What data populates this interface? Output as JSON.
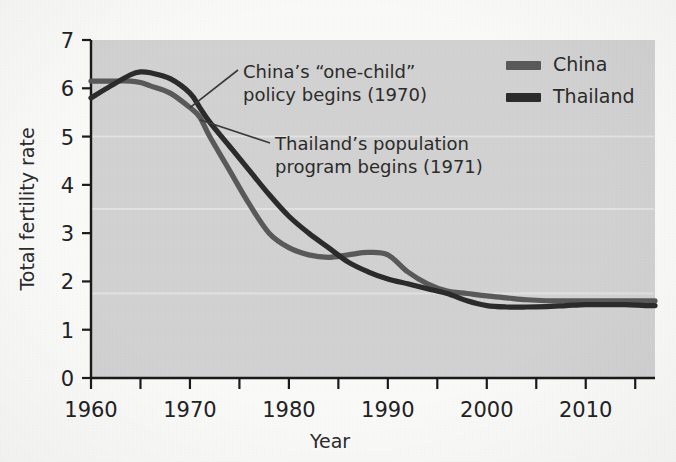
{
  "chart_data": {
    "type": "line",
    "title": "",
    "xlabel": "Year",
    "ylabel": "Total fertility rate",
    "xlim": [
      1960,
      2017
    ],
    "ylim": [
      0,
      7
    ],
    "xticks": [
      1960,
      1970,
      1980,
      1990,
      2000,
      2010
    ],
    "xminor_ticks": [
      1965,
      1975,
      1985,
      1995,
      2005,
      2015
    ],
    "yticks": [
      0,
      1,
      2,
      3,
      4,
      5,
      6,
      7
    ],
    "grid": "faint-horizontal",
    "legend_position": "top-right",
    "plot_background": "#d2d2d2",
    "series": [
      {
        "name": "China",
        "color": "#5a5a5a",
        "x": [
          1960,
          1962,
          1964,
          1965,
          1966,
          1968,
          1970,
          1971,
          1972,
          1974,
          1976,
          1978,
          1980,
          1982,
          1984,
          1986,
          1988,
          1990,
          1992,
          1994,
          1996,
          1998,
          2000,
          2002,
          2004,
          2006,
          2008,
          2010,
          2012,
          2014,
          2016,
          2017
        ],
        "y": [
          6.15,
          6.15,
          6.15,
          6.12,
          6.05,
          5.9,
          5.6,
          5.4,
          5.0,
          4.3,
          3.6,
          3.0,
          2.7,
          2.55,
          2.5,
          2.55,
          2.6,
          2.55,
          2.2,
          1.95,
          1.8,
          1.75,
          1.7,
          1.66,
          1.62,
          1.6,
          1.6,
          1.6,
          1.6,
          1.6,
          1.6,
          1.6
        ]
      },
      {
        "name": "Thailand",
        "color": "#2b2b2b",
        "x": [
          1960,
          1962,
          1964,
          1965,
          1966,
          1968,
          1970,
          1971,
          1972,
          1974,
          1976,
          1978,
          1980,
          1982,
          1984,
          1986,
          1988,
          1990,
          1992,
          1994,
          1996,
          1998,
          2000,
          2002,
          2004,
          2006,
          2008,
          2010,
          2012,
          2014,
          2016,
          2017
        ],
        "y": [
          5.8,
          6.05,
          6.28,
          6.34,
          6.32,
          6.2,
          5.9,
          5.6,
          5.3,
          4.8,
          4.3,
          3.8,
          3.35,
          3.0,
          2.7,
          2.4,
          2.2,
          2.05,
          1.95,
          1.85,
          1.75,
          1.6,
          1.5,
          1.47,
          1.47,
          1.48,
          1.5,
          1.52,
          1.52,
          1.52,
          1.5,
          1.5
        ]
      }
    ],
    "annotations": [
      {
        "id": "china-policy",
        "line1": "China’s “one-child”",
        "line2": "policy begins (1970)",
        "target_year": 1970,
        "target_value": 5.6
      },
      {
        "id": "thailand-program",
        "line1": "Thailand’s population",
        "line2": "program begins (1971)",
        "target_year": 1971,
        "target_value": 5.35
      }
    ]
  },
  "legend": {
    "items": [
      {
        "label": "China",
        "color": "#5a5a5a"
      },
      {
        "label": "Thailand",
        "color": "#2b2b2b"
      }
    ]
  },
  "axes": {
    "x_title": "Year",
    "y_title": "Total fertility rate",
    "x_tick_labels": [
      "1960",
      "1970",
      "1980",
      "1990",
      "2000",
      "2010"
    ],
    "y_tick_labels": [
      "0",
      "1",
      "2",
      "3",
      "4",
      "5",
      "6",
      "7"
    ]
  }
}
